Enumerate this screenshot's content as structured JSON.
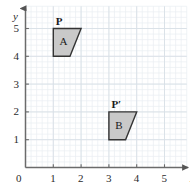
{
  "figure": {
    "background_color": "#ffffff",
    "grid": {
      "minor_color": "#e9eef2",
      "major_color": "#d8e0e6",
      "minor_step": 0.2,
      "major_step": 1,
      "x_range": [
        0,
        5.8
      ],
      "y_range": [
        0,
        5.8
      ],
      "visible": true
    },
    "axes": {
      "color": "#6b6b6b",
      "x_label": "x",
      "y_label": "y",
      "x_ticks": [
        "0",
        "1",
        "2",
        "3",
        "4",
        "5"
      ],
      "y_ticks": [
        "0",
        "1",
        "2",
        "3",
        "4",
        "5"
      ],
      "x_tick_values": [
        0,
        1,
        2,
        3,
        4,
        5
      ],
      "y_tick_values": [
        0,
        1,
        2,
        3,
        4,
        5
      ],
      "origin_label": "0",
      "arrowheads": true
    },
    "shapes": [
      {
        "name": "A",
        "label": "A",
        "vertex_label": "P",
        "vertex_label_point": [
          1.0,
          5.0
        ],
        "fill": "#c9c9c9",
        "stroke": "#333333",
        "points": [
          [
            1.0,
            5.0
          ],
          [
            2.0,
            5.0
          ],
          [
            1.6,
            4.0
          ],
          [
            1.0,
            4.0
          ]
        ],
        "label_point": [
          1.35,
          4.5
        ]
      },
      {
        "name": "B",
        "label": "B",
        "vertex_label": "P′",
        "vertex_label_point": [
          3.0,
          2.0
        ],
        "fill": "#c9c9c9",
        "stroke": "#333333",
        "points": [
          [
            3.0,
            2.0
          ],
          [
            4.0,
            2.0
          ],
          [
            3.6,
            1.0
          ],
          [
            3.0,
            1.0
          ]
        ],
        "label_point": [
          3.35,
          1.5
        ]
      }
    ]
  }
}
